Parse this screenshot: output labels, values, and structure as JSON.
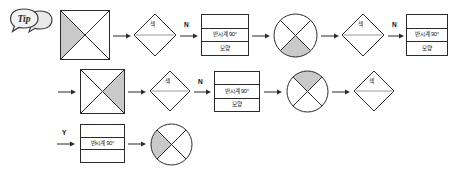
{
  "document": {
    "kind": "flowchart",
    "language": "ko",
    "background_color": "#ffffff",
    "stroke_color": "#2b2b2b",
    "shade_color": "#c9c9c9"
  },
  "badge": {
    "label": "Tip",
    "name": "tip-badge"
  },
  "labels": {
    "branch_n": "N",
    "branch_y": "Y",
    "decision_color": "색",
    "process_rotate": "반시계 90°",
    "process_shape": "모양",
    "empty": ""
  },
  "rows": [
    {
      "id": "row-1",
      "steps": [
        {
          "type": "square",
          "name": "square-shaded-left",
          "shade": "left"
        },
        {
          "type": "arrow",
          "name": "arrow-right",
          "label": ""
        },
        {
          "type": "decision",
          "name": "decision-color",
          "label": "색"
        },
        {
          "type": "arrow",
          "name": "arrow-right-branch-n",
          "label": "N"
        },
        {
          "type": "process",
          "name": "process-rotate-shape",
          "rows": [
            "",
            "반시계 90°",
            "모양"
          ]
        },
        {
          "type": "arrow",
          "name": "arrow-right",
          "label": ""
        },
        {
          "type": "circle",
          "name": "circle-shaded-bottom",
          "shade": "bottom"
        },
        {
          "type": "arrow",
          "name": "arrow-right",
          "label": ""
        },
        {
          "type": "decision",
          "name": "decision-color",
          "label": "색"
        },
        {
          "type": "arrow",
          "name": "arrow-right-branch-n",
          "label": "N"
        },
        {
          "type": "process",
          "name": "process-rotate-shape",
          "rows": [
            "",
            "반시계 90°",
            "모양"
          ]
        }
      ]
    },
    {
      "id": "row-2",
      "steps": [
        {
          "type": "arrow",
          "name": "arrow-right",
          "label": ""
        },
        {
          "type": "square",
          "name": "square-shaded-right",
          "shade": "right"
        },
        {
          "type": "arrow",
          "name": "arrow-right",
          "label": ""
        },
        {
          "type": "decision",
          "name": "decision-color",
          "label": "색"
        },
        {
          "type": "arrow",
          "name": "arrow-right-branch-n",
          "label": "N"
        },
        {
          "type": "process",
          "name": "process-rotate-shape",
          "rows": [
            "",
            "반시계 90°",
            "모양"
          ]
        },
        {
          "type": "arrow",
          "name": "arrow-right",
          "label": ""
        },
        {
          "type": "circle",
          "name": "circle-shaded-top",
          "shade": "top"
        },
        {
          "type": "arrow",
          "name": "arrow-right",
          "label": ""
        },
        {
          "type": "decision",
          "name": "decision-color",
          "label": "색"
        }
      ]
    },
    {
      "id": "row-3",
      "steps": [
        {
          "type": "arrow",
          "name": "arrow-right-branch-y",
          "label": "Y"
        },
        {
          "type": "process",
          "name": "process-rotate",
          "rows": [
            "",
            "반시계 90°",
            ""
          ]
        },
        {
          "type": "arrow",
          "name": "arrow-right",
          "label": ""
        },
        {
          "type": "circle",
          "name": "circle-shaded-left",
          "shade": "left"
        }
      ]
    }
  ]
}
